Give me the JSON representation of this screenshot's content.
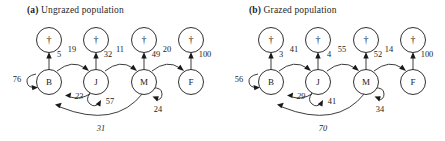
{
  "figure": {
    "panels": [
      {
        "id": "a",
        "tag": "(a)",
        "title": "Ungrazed population",
        "stage_nodes": [
          {
            "id": "B",
            "label": "B"
          },
          {
            "id": "J",
            "label": "J"
          },
          {
            "id": "M",
            "label": "M"
          },
          {
            "id": "F",
            "label": "F"
          }
        ],
        "death_nodes": [
          {
            "id": "dB",
            "label": "†"
          },
          {
            "id": "dJ",
            "label": "†"
          },
          {
            "id": "dM",
            "label": "†"
          },
          {
            "id": "dF",
            "label": "†"
          }
        ],
        "transitions": [
          {
            "from": "B",
            "to": "dB",
            "value": "5",
            "kind": "mortality"
          },
          {
            "from": "J",
            "to": "dJ",
            "value": "32",
            "kind": "mortality"
          },
          {
            "from": "M",
            "to": "dM",
            "value": "49",
            "kind": "mortality"
          },
          {
            "from": "F",
            "to": "dF",
            "value": "100",
            "kind": "mortality"
          },
          {
            "from": "B",
            "to": "J",
            "value": "19",
            "kind": "progression"
          },
          {
            "from": "J",
            "to": "M",
            "value": "11",
            "kind": "progression"
          },
          {
            "from": "M",
            "to": "F",
            "value": "20",
            "kind": "progression"
          },
          {
            "from": "B",
            "to": "B",
            "value": "76",
            "kind": "stasis"
          },
          {
            "from": "J",
            "to": "J",
            "value": "57",
            "kind": "stasis"
          },
          {
            "from": "M",
            "to": "M",
            "value": "24",
            "kind": "stasis"
          },
          {
            "from": "J",
            "to": "B",
            "value": "23",
            "kind": "retrogression"
          },
          {
            "from": "M",
            "to": "B",
            "value": "31",
            "kind": "retrogression"
          }
        ]
      },
      {
        "id": "b",
        "tag": "(b)",
        "title": "Grazed population",
        "stage_nodes": [
          {
            "id": "B",
            "label": "B"
          },
          {
            "id": "J",
            "label": "J"
          },
          {
            "id": "M",
            "label": "M"
          },
          {
            "id": "F",
            "label": "F"
          }
        ],
        "death_nodes": [
          {
            "id": "dB",
            "label": "†"
          },
          {
            "id": "dJ",
            "label": "†"
          },
          {
            "id": "dM",
            "label": "†"
          },
          {
            "id": "dF",
            "label": "†"
          }
        ],
        "transitions": [
          {
            "from": "B",
            "to": "dB",
            "value": "3",
            "kind": "mortality"
          },
          {
            "from": "J",
            "to": "dJ",
            "value": "4",
            "kind": "mortality"
          },
          {
            "from": "M",
            "to": "dM",
            "value": "52",
            "kind": "mortality"
          },
          {
            "from": "F",
            "to": "dF",
            "value": "100",
            "kind": "mortality"
          },
          {
            "from": "B",
            "to": "J",
            "value": "41",
            "kind": "progression"
          },
          {
            "from": "J",
            "to": "M",
            "value": "55",
            "kind": "progression"
          },
          {
            "from": "M",
            "to": "F",
            "value": "14",
            "kind": "progression"
          },
          {
            "from": "B",
            "to": "B",
            "value": "56",
            "kind": "stasis"
          },
          {
            "from": "J",
            "to": "J",
            "value": "41",
            "kind": "stasis"
          },
          {
            "from": "M",
            "to": "M",
            "value": "34",
            "kind": "stasis"
          },
          {
            "from": "J",
            "to": "B",
            "value": "29",
            "kind": "retrogression"
          },
          {
            "from": "M",
            "to": "B",
            "value": "70",
            "kind": "retrogression"
          }
        ]
      }
    ],
    "colors": {
      "background": "#ffffff",
      "ink": "#1a1a1a"
    }
  }
}
